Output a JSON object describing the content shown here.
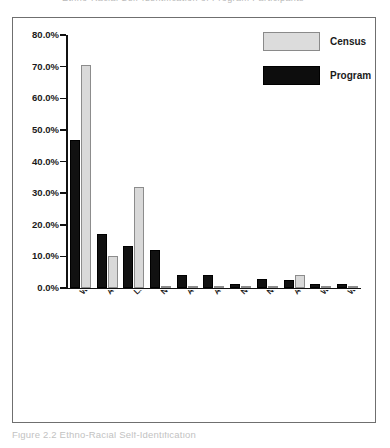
{
  "top_partial_text": "Ethno-Racial Self-Identification of Program Participants",
  "caption": "Figure 2.2  Ethno-Racial Self-Identification",
  "legend": {
    "position": "top-right",
    "entries": [
      {
        "label": "Census",
        "color": "#d9d9d9",
        "swatch": "census"
      },
      {
        "label": "Program",
        "color": "#111111",
        "swatch": "program"
      }
    ]
  },
  "axis": {
    "y_ticks": [
      "0.0%",
      "10.0%",
      "20.0%",
      "30.0%",
      "40.0%",
      "50.0%",
      "60.0%",
      "70.0%",
      "80.0%"
    ]
  },
  "chart_data": {
    "type": "bar",
    "title": "Ethno-Racial Self-Identification",
    "xlabel": "",
    "ylabel": "",
    "ylim": [
      0,
      80
    ],
    "ytick_step": 10,
    "grid": false,
    "legend_position": "top-right",
    "value_format": "percent",
    "categories": [
      "White",
      "African American",
      "Latina",
      "Not Provided",
      "African American and Latina/Afro Caribbean",
      "African American and White/Latina",
      "Native American",
      "Native American and White",
      "Asian",
      "White and Pacific Islander",
      "White/Middle Eastern Jewish"
    ],
    "series": [
      {
        "name": "Program",
        "color": "#111111",
        "values": [
          46.8,
          17.2,
          13.4,
          12.0,
          4.0,
          4.0,
          1.3,
          2.7,
          2.4,
          1.3,
          1.3
        ]
      },
      {
        "name": "Census",
        "color": "#d9d9d9",
        "values": [
          70.5,
          10.2,
          32.0,
          0.0,
          0.0,
          0.0,
          0.5,
          0.0,
          4.0,
          0.2,
          0.0
        ]
      }
    ]
  }
}
